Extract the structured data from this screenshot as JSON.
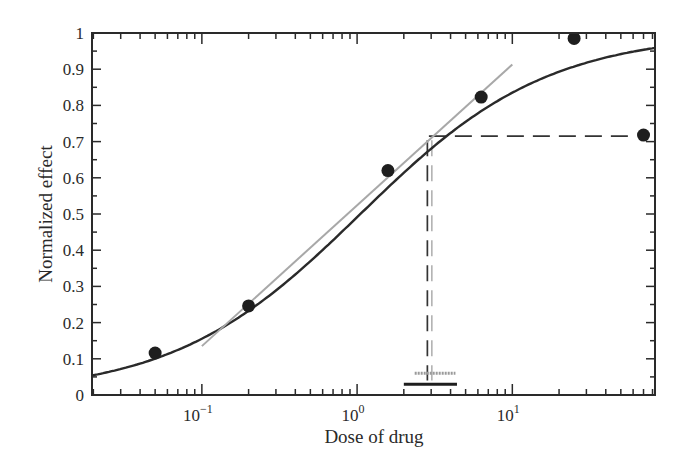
{
  "chart_data": {
    "type": "scatter",
    "title": "",
    "xlabel": "Dose of drug",
    "ylabel": "Normalized effect",
    "xscale": "log",
    "xlim": [
      0.0196,
      83
    ],
    "ylim": [
      0,
      1
    ],
    "grid": false,
    "legend": null,
    "x_tick_labels": [
      {
        "value": 0.1,
        "base": "10",
        "exp": "−1"
      },
      {
        "value": 1,
        "base": "10",
        "exp": "0"
      },
      {
        "value": 10,
        "base": "10",
        "exp": "1"
      }
    ],
    "y_tick_labels": [
      "0",
      "0.1",
      "0.2",
      "0.3",
      "0.4",
      "0.5",
      "0.6",
      "0.7",
      "0.8",
      "0.9",
      "1"
    ],
    "series": [
      {
        "name": "Measured points",
        "kind": "scatter",
        "x": [
          0.05,
          0.2,
          1.58,
          6.3,
          25,
          70
        ],
        "y": [
          0.116,
          0.246,
          0.62,
          0.823,
          0.985,
          0.718
        ],
        "color": "#1e1e1e"
      },
      {
        "name": "Fitted dose-response curve",
        "kind": "line",
        "model": "hill",
        "ec50": 1.05,
        "hill": 0.72,
        "color": "#2a2a2a"
      },
      {
        "name": "Linear tangent (gray)",
        "kind": "line",
        "x": [
          0.1,
          10
        ],
        "y": [
          0.135,
          0.913
        ],
        "color": "#a8a8a8"
      }
    ],
    "annotations": [
      {
        "type": "dashed-horizontal",
        "y": 0.715,
        "x_from": 2.9,
        "x_to": 70,
        "label": "effect level"
      },
      {
        "type": "double-dashed-vertical",
        "x": 2.9,
        "y_from": 0.715,
        "y_to": 0.04
      },
      {
        "type": "range-bar-black",
        "x_from": 2.0,
        "x_to": 4.4,
        "y": 0.03
      },
      {
        "type": "range-bar-gray",
        "x_from": 2.35,
        "x_to": 4.3,
        "y": 0.06
      }
    ]
  }
}
